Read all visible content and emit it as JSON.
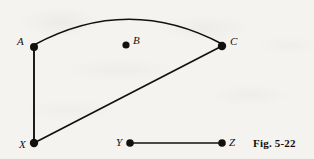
{
  "figure": {
    "caption": "Fig. 5-22",
    "caption_position": {
      "x": 253,
      "y": 138
    },
    "background_color": "#f4f3f0",
    "ink_color": "#14100d",
    "width": 314,
    "height": 159
  },
  "vertices": [
    {
      "id": "A",
      "label": "A",
      "cx": 34,
      "cy": 47,
      "r": 4.0,
      "label_x": 17,
      "label_y": 36
    },
    {
      "id": "B",
      "label": "B",
      "cx": 126,
      "cy": 45,
      "r": 3.6,
      "label_x": 133,
      "label_y": 35
    },
    {
      "id": "C",
      "label": "C",
      "cx": 222,
      "cy": 46,
      "r": 4.2,
      "label_x": 230,
      "label_y": 36
    },
    {
      "id": "X",
      "label": "X",
      "cx": 34,
      "cy": 143,
      "r": 4.2,
      "label_x": 19,
      "label_y": 139
    },
    {
      "id": "Y",
      "label": "Y",
      "cx": 130,
      "cy": 143,
      "r": 3.8,
      "label_x": 116,
      "label_y": 137
    },
    {
      "id": "Z",
      "label": "Z",
      "cx": 222,
      "cy": 143,
      "r": 3.8,
      "label_x": 229,
      "label_y": 137
    }
  ],
  "edges": [
    {
      "id": "arc-A-C",
      "from": "A",
      "to": "C",
      "shape": "arc",
      "path": "M 34 45 Q 128 -6 222 44",
      "stroke_width": 1.6
    },
    {
      "id": "line-A-X",
      "from": "A",
      "to": "X",
      "shape": "straight",
      "path": "M 34 47 L 34 143",
      "stroke_width": 1.9
    },
    {
      "id": "line-X-C",
      "from": "X",
      "to": "C",
      "shape": "straight",
      "path": "M 34 143 L 222 46",
      "stroke_width": 1.7
    },
    {
      "id": "line-Y-Z",
      "from": "Y",
      "to": "Z",
      "shape": "straight",
      "path": "M 130 143 L 222 143",
      "stroke_width": 1.7
    }
  ]
}
